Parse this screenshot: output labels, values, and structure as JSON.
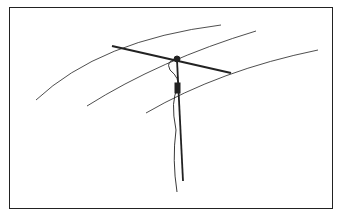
{
  "diagram": {
    "colors": {
      "line": "#222222",
      "background": "#ffffff",
      "frame": "#222222"
    },
    "elements": [
      "antenna-element",
      "center-insulator",
      "mast",
      "feedline",
      "field-curves"
    ]
  }
}
